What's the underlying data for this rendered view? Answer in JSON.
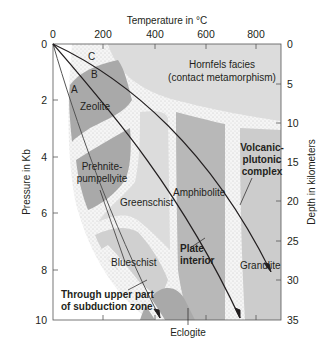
{
  "diagram": {
    "type": "metamorphic-facies-pressure-temperature-diagram",
    "x_axis": {
      "title": "Temperature in °C",
      "ticks": [
        "0",
        "200",
        "400",
        "600",
        "800"
      ],
      "position": "top"
    },
    "y_axis_left": {
      "title": "Pressure in Kb",
      "ticks": [
        "0",
        "2",
        "4",
        "6",
        "8",
        "10"
      ]
    },
    "y_axis_right": {
      "title": "Depth in kilometers",
      "ticks": [
        "0",
        "5",
        "10",
        "15",
        "20",
        "25",
        "30",
        "35"
      ]
    },
    "facies": {
      "hornfels_line1": "Hornfels facies",
      "hornfels_line2": "(contact metamorphism)",
      "zeolite": "Zeolite",
      "prehnite_line1": "Prehnite-",
      "prehnite_line2": "pumpellyite",
      "greenschist": "Greenschist",
      "amphibolite": "Amphibolite",
      "blueschist": "Blueschist",
      "granulite": "Granulite",
      "eclogite": "Eclogite"
    },
    "gradients": {
      "a": "A",
      "b": "B",
      "c": "C"
    },
    "annotations": {
      "volcanic_line1": "Volcanic-",
      "volcanic_line2": "plutonic",
      "volcanic_line3": "complex",
      "plate_line1": "Plate",
      "plate_line2": "interior",
      "subduction_line1": "Through upper part",
      "subduction_line2": "of subduction zone"
    },
    "colors": {
      "light_gray": "#dcdcdc",
      "mid_gray": "#c4c4c4",
      "dark_gray": "#a9a9a9",
      "stipple_bg": "#f4f4f4",
      "line": "#231f20"
    }
  }
}
